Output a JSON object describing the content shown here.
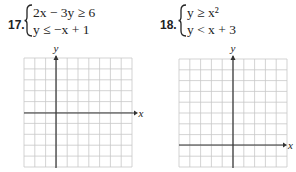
{
  "problems": [
    {
      "number": "17.",
      "system": [
        {
          "text": "2x − 3y ≥ 6"
        },
        {
          "text": "y ≤ −x + 1"
        }
      ],
      "graph": {
        "x_label": "x",
        "y_label": "y",
        "grid_cols": 10,
        "grid_rows": 10,
        "y_axis_col_index": 3,
        "x_axis_row_index": 5
      }
    },
    {
      "number": "18.",
      "system": [
        {
          "text": "y ≥ x²"
        },
        {
          "text": "y < x + 3"
        }
      ],
      "graph": {
        "x_label": "x",
        "y_label": "y",
        "grid_cols": 10,
        "grid_rows": 10,
        "y_axis_col_index": 5,
        "x_axis_row_index": 8
      }
    }
  ],
  "colors": {
    "grid": "#c8c8c8",
    "axis": "#333333",
    "text": "#222222"
  }
}
